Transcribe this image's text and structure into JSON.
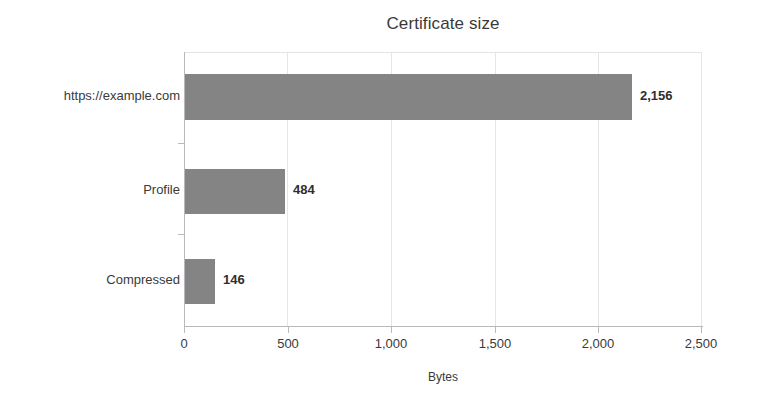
{
  "chart_data": {
    "type": "bar",
    "orientation": "horizontal",
    "title": "Certificate size",
    "xlabel": "Bytes",
    "ylabel": "",
    "categories": [
      "https://example.com",
      "Profile",
      "Compressed"
    ],
    "values": [
      2156,
      484,
      146
    ],
    "value_labels": [
      "2,156",
      "484",
      "146"
    ],
    "xlim": [
      0,
      2500
    ],
    "xticks": [
      0,
      500,
      1000,
      1500,
      2000,
      2500
    ],
    "xtick_labels": [
      "0",
      "500",
      "1,000",
      "1,500",
      "2,000",
      "2,500"
    ],
    "grid": true,
    "grid_axis": "x",
    "legend": false,
    "bar_color": "#848484",
    "text_color": "#3a3a3a",
    "gridline_color": "#e6e6e6",
    "axis_color": "#b9b9b9",
    "background_color": "#ffffff"
  }
}
